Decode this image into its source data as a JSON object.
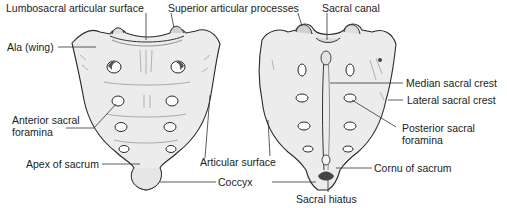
{
  "figure": {
    "views": [
      "anterior",
      "posterior"
    ]
  },
  "labels": {
    "lumbosacral_articular_surface": "Lumbosacral articular surface",
    "superior_articular_processes": "Superior articular processes",
    "sacral_canal": "Sacral canal",
    "ala": "Ala (wing)",
    "anterior_sacral_foramina_1": "Anterior sacral",
    "anterior_sacral_foramina_2": "foramina",
    "apex_of_sacrum": "Apex of sacrum",
    "articular_surface": "Articular surface",
    "coccyx": "Coccyx",
    "median_sacral_crest": "Median sacral crest",
    "lateral_sacral_crest": "Lateral sacral crest",
    "posterior_sacral_foramina_1": "Posterior sacral",
    "posterior_sacral_foramina_2": "foramina",
    "cornu_of_sacrum": "Cornu of sacrum",
    "sacral_hiatus": "Sacral hiatus"
  },
  "colors": {
    "bone_fill": "#e9e9e9",
    "bone_stroke": "#2a2a2a",
    "shading": "#8a8a8a",
    "leader": "#333333",
    "background": "#ffffff"
  }
}
